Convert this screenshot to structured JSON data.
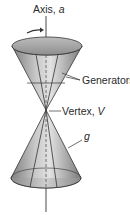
{
  "figure": {
    "labels": {
      "axis": "Axis, ",
      "axis_var": "a",
      "generators": "Generators",
      "vertex": "Vertex, ",
      "vertex_var": "V",
      "generator_var": "g"
    },
    "colors": {
      "cone_fill_dark": "#8c8c8c",
      "cone_fill_light": "#d6d6d6",
      "outline": "#333333",
      "text": "#2a2a2a"
    },
    "icons": {
      "rotation_arrow": "curved-arrow-right"
    }
  }
}
